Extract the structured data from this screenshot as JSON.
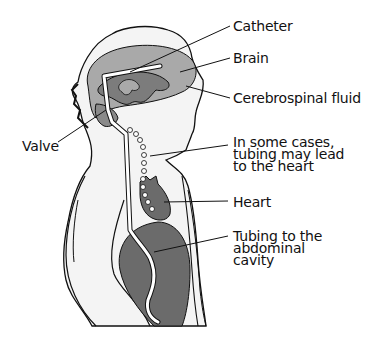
{
  "diagram": {
    "colors": {
      "background": "#ffffff",
      "body_fill": "#f4f4f4",
      "outline": "#111111",
      "brain": "#a9a9a9",
      "csf": "#7c7c7c",
      "organ": "#6b6b6b",
      "tube": "#ffffff"
    },
    "labels": {
      "catheter": "Catheter",
      "brain": "Brain",
      "csf": "Cerebrospinal fluid",
      "valve": "Valve",
      "heart_note": "In some cases,\ntubing may lead\nto the heart",
      "heart": "Heart",
      "abdominal": "Tubing to the\nabdominal\ncavity"
    }
  }
}
